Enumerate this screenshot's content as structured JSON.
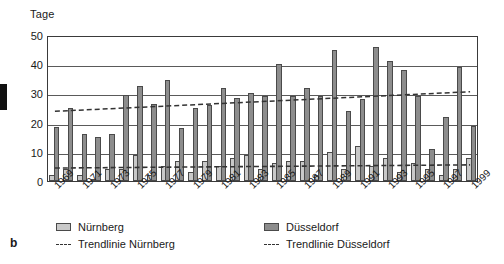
{
  "figure": {
    "panel_label": "b",
    "axis_title": "Tage"
  },
  "legend": {
    "position": "bottom",
    "items": [
      {
        "label": "Nürnberg",
        "marker": "swatch-light",
        "color": "#c9c9c9"
      },
      {
        "label": "Düsseldorf",
        "marker": "swatch-dark",
        "color": "#8d8d8d"
      },
      {
        "label": "Trendlinie Nürnberg",
        "marker": "dashed-line",
        "color": "#333333"
      },
      {
        "label": "Trendlinie Düsseldorf",
        "marker": "dashed-line",
        "color": "#333333"
      }
    ]
  },
  "chart_data": {
    "type": "bar",
    "title": "",
    "subtitle": "",
    "xlabel": "",
    "ylabel": "Tage",
    "ylim": [
      0,
      50
    ],
    "ytick_step": 10,
    "yticks": [
      0,
      10,
      20,
      30,
      40,
      50
    ],
    "ytick_labels": [
      "0",
      "10",
      "20",
      "30",
      "40",
      "50"
    ],
    "grid": true,
    "grid_axis": "y",
    "categories": [
      1969,
      1970,
      1971,
      1972,
      1973,
      1974,
      1975,
      1976,
      1977,
      1978,
      1979,
      1980,
      1981,
      1982,
      1983,
      1984,
      1985,
      1986,
      1987,
      1988,
      1989,
      1990,
      1991,
      1992,
      1993,
      1994,
      1995,
      1996,
      1997,
      1998,
      1999
    ],
    "xtick_labels": [
      "1969",
      "1971",
      "1973",
      "1975",
      "1977",
      "1979",
      "1981",
      "1983",
      "1985",
      "1987",
      "1989",
      "1991",
      "1993",
      "1995",
      "1997",
      "1999"
    ],
    "xtick_values": [
      1969,
      1971,
      1973,
      1975,
      1977,
      1979,
      1981,
      1983,
      1985,
      1987,
      1989,
      1991,
      1993,
      1995,
      1997,
      1999
    ],
    "xtick_rotation": -45,
    "series": [
      {
        "name": "Nürnberg",
        "color": "#c9c9c9",
        "values": [
          2,
          4,
          2,
          0.5,
          4,
          4,
          9,
          2,
          5,
          7,
          3,
          7,
          5,
          8,
          9,
          4,
          6,
          7,
          7,
          2,
          10,
          4,
          12,
          5,
          8,
          3,
          6,
          4,
          2,
          4,
          8
        ]
      },
      {
        "name": "Düsseldorf",
        "color": "#8d8d8d",
        "values": [
          18.5,
          25,
          16,
          15,
          16,
          29.5,
          32.5,
          26.5,
          34.5,
          18,
          25,
          26,
          32,
          28.5,
          30,
          29,
          40,
          29,
          32,
          29,
          45,
          24,
          28,
          46,
          41,
          38,
          29,
          11,
          22,
          39,
          19
        ]
      }
    ],
    "trendlines": [
      {
        "name": "Trendlinie Nürnberg",
        "style": "dashed",
        "color": "#333333",
        "start": {
          "x": 1969,
          "y": 4.5
        },
        "end": {
          "x": 1999,
          "y": 5.6
        }
      },
      {
        "name": "Trendlinie Düsseldorf",
        "style": "dashed",
        "color": "#333333",
        "start": {
          "x": 1969,
          "y": 24.2
        },
        "end": {
          "x": 1999,
          "y": 31.0
        }
      }
    ]
  }
}
